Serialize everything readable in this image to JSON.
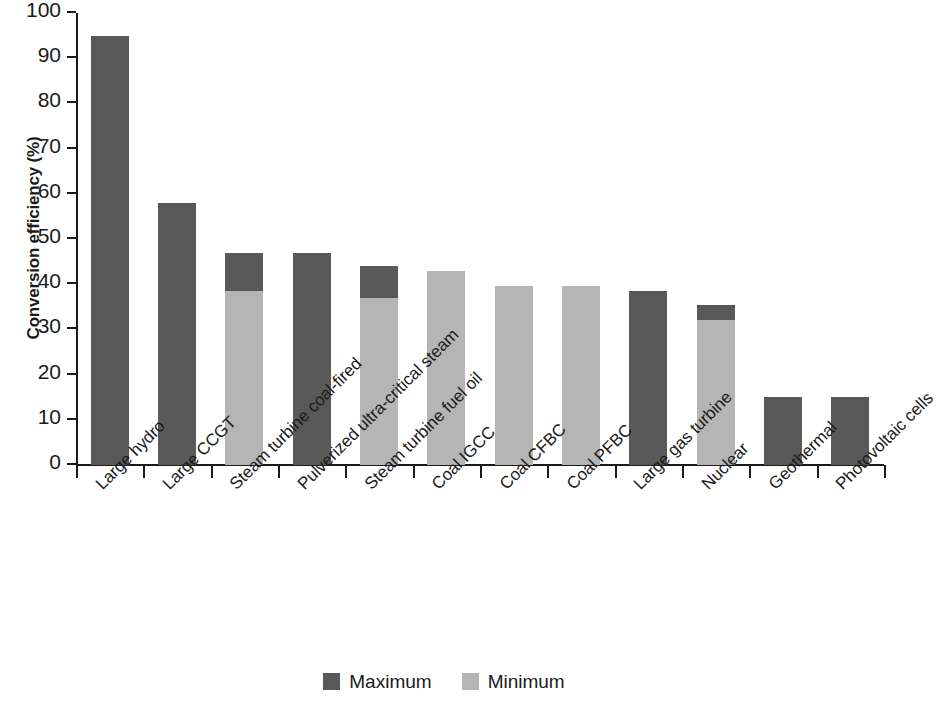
{
  "chart_data": {
    "type": "bar",
    "title": "",
    "subtitle": "",
    "xlabel": "",
    "ylabel": "Conversion efficiency (%)",
    "ylim": [
      0,
      100
    ],
    "yticks": [
      0,
      10,
      20,
      30,
      40,
      50,
      60,
      70,
      80,
      90,
      100
    ],
    "ytick_labels": [
      "0",
      "10",
      "20",
      "30",
      "40",
      "50",
      "60",
      "70",
      "80",
      "90",
      "100"
    ],
    "grid": false,
    "legend_position": "bottom-center",
    "stacked": true,
    "categories": [
      "Large hydro",
      "Large CCGT",
      "Steam turbine coal-fired",
      "Pulverized ultra-critical steam",
      "Steam turbine fuel oil",
      "Coal IGCC",
      "Coal CFBC",
      "Coal PFBC",
      "Large gas turbine",
      "Nuclear",
      "Geothermal",
      "Photovoltaic cells"
    ],
    "series": [
      {
        "name": "Maximum",
        "color": "#595959",
        "values": [
          95,
          58,
          47,
          47,
          44,
          43,
          39.5,
          39.5,
          38.5,
          35.5,
          15,
          15
        ]
      },
      {
        "name": "Minimum",
        "color": "#b5b5b5",
        "values": [
          95,
          58,
          38.5,
          47,
          37,
          43,
          39.5,
          39.5,
          38.5,
          32,
          15,
          15
        ]
      }
    ],
    "bars": [
      {
        "category": "Large hydro",
        "max": 95,
        "min": 95,
        "min_visible": false
      },
      {
        "category": "Large CCGT",
        "max": 58,
        "min": 58,
        "min_visible": false
      },
      {
        "category": "Steam turbine coal-fired",
        "max": 47,
        "min": 38.5,
        "min_visible": true
      },
      {
        "category": "Pulverized ultra-critical steam",
        "max": 47,
        "min": 47,
        "min_visible": false
      },
      {
        "category": "Steam turbine fuel oil",
        "max": 44,
        "min": 37,
        "min_visible": true
      },
      {
        "category": "Coal IGCC",
        "max": 43,
        "min": 43,
        "min_visible": true
      },
      {
        "category": "Coal CFBC",
        "max": 39.5,
        "min": 39.5,
        "min_visible": true
      },
      {
        "category": "Coal PFBC",
        "max": 39.5,
        "min": 39.5,
        "min_visible": true
      },
      {
        "category": "Large gas turbine",
        "max": 38.5,
        "min": 38.5,
        "min_visible": false
      },
      {
        "category": "Nuclear",
        "max": 35.5,
        "min": 32,
        "min_visible": true
      },
      {
        "category": "Geothermal",
        "max": 15,
        "min": 15,
        "min_visible": false
      },
      {
        "category": "Photovoltaic cells",
        "max": 15,
        "min": 15,
        "min_visible": false
      }
    ]
  },
  "legend": {
    "items": [
      {
        "label": "Maximum",
        "color": "#595959"
      },
      {
        "label": "Minimum",
        "color": "#b5b5b5"
      }
    ]
  },
  "colors": {
    "maximum": "#595959",
    "minimum": "#b5b5b5",
    "axis": "#1a1a1a",
    "background": "#ffffff"
  }
}
